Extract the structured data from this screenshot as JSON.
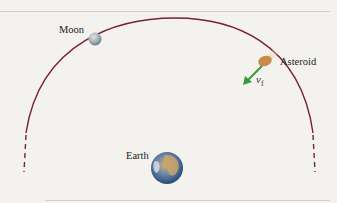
{
  "diagram": {
    "labels": {
      "moon": "Moon",
      "asteroid": "Asteroid",
      "earth": "Earth",
      "velocity_symbol": "v",
      "velocity_subscript": "f"
    },
    "colors": {
      "orbit": "#7a1e3c",
      "velocity_arrow": "#3a9a3a",
      "background": "#f3f2ee",
      "moon": "#9aa6b0",
      "asteroid": "#c98a4a"
    }
  }
}
